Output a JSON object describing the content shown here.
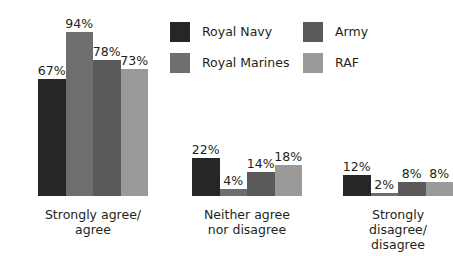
{
  "chart_data": {
    "type": "bar",
    "title": "",
    "subtitle": "",
    "xlabel": "",
    "ylabel": "",
    "ylim": [
      0,
      100
    ],
    "grid": false,
    "legend_position": "top-right",
    "value_suffix": "%",
    "categories": [
      "Strongly agree/\nagree",
      "Neither agree\nnor disagree",
      "Strongly disagree/\ndisagree"
    ],
    "series": [
      {
        "name": "Royal Navy",
        "color": "#262626",
        "values": [
          67,
          22,
          12
        ],
        "labels": [
          "67%",
          "22%",
          "12%"
        ]
      },
      {
        "name": "Royal Marines",
        "color": "#6e6e6e",
        "values": [
          94,
          4,
          2
        ],
        "labels": [
          "94%",
          "4%",
          "2%"
        ]
      },
      {
        "name": "Army",
        "color": "#5a5a5a",
        "values": [
          78,
          14,
          8
        ],
        "labels": [
          "78%",
          "14%",
          "8%"
        ]
      },
      {
        "name": "RAF",
        "color": "#9a9a9a",
        "values": [
          73,
          18,
          8
        ],
        "labels": [
          "73%",
          "18%",
          "8%"
        ]
      }
    ]
  },
  "legend": {
    "items": [
      {
        "label": "Royal Navy",
        "color": "#262626"
      },
      {
        "label": "Royal Marines",
        "color": "#6e6e6e"
      },
      {
        "label": "Army",
        "color": "#5a5a5a"
      },
      {
        "label": "RAF",
        "color": "#9a9a9a"
      }
    ]
  },
  "groups": [
    {
      "label": "Strongly agree/\nagree",
      "bars": [
        {
          "series": "Royal Navy",
          "value": 67,
          "label": "67%",
          "color": "#262626"
        },
        {
          "series": "Royal Marines",
          "value": 94,
          "label": "94%",
          "color": "#6e6e6e"
        },
        {
          "series": "Army",
          "value": 78,
          "label": "78%",
          "color": "#5a5a5a"
        },
        {
          "series": "RAF",
          "value": 73,
          "label": "73%",
          "color": "#9a9a9a"
        }
      ]
    },
    {
      "label": "Neither agree\nnor disagree",
      "bars": [
        {
          "series": "Royal Navy",
          "value": 22,
          "label": "22%",
          "color": "#262626"
        },
        {
          "series": "Royal Marines",
          "value": 4,
          "label": "4%",
          "color": "#6e6e6e"
        },
        {
          "series": "Army",
          "value": 14,
          "label": "14%",
          "color": "#5a5a5a"
        },
        {
          "series": "RAF",
          "value": 18,
          "label": "18%",
          "color": "#9a9a9a"
        }
      ]
    },
    {
      "label": "Strongly disagree/\ndisagree",
      "bars": [
        {
          "series": "Royal Navy",
          "value": 12,
          "label": "12%",
          "color": "#262626"
        },
        {
          "series": "Royal Marines",
          "value": 2,
          "label": "2%",
          "color": "#6e6e6e"
        },
        {
          "series": "Army",
          "value": 8,
          "label": "8%",
          "color": "#5a5a5a"
        },
        {
          "series": "RAF",
          "value": 8,
          "label": "8%",
          "color": "#9a9a9a"
        }
      ]
    }
  ],
  "layout": {
    "px_per_percent": 1.745,
    "bar_width": 27.5,
    "group_left": [
      38,
      192,
      343
    ],
    "baseline_y": 196
  }
}
